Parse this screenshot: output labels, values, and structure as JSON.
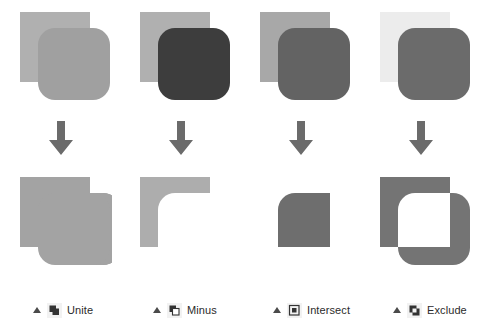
{
  "page": {
    "background": "#ffffff"
  },
  "colors": {
    "light_gray": "#aaaaaa",
    "mid_gray": "#999999",
    "pale_gray": "#b3b3b3",
    "very_light_gray": "#eeeeee",
    "dark_gray": "#6e6e6e",
    "darkest_gray": "#3d3d3d",
    "arrow": "#6b6b6b",
    "caption_text": "#2b2b2b",
    "caption_marker": "#4a4a4a",
    "icon_dark": "#333333",
    "icon_frame": "#f2f2f2",
    "result_unite": "#a3a3a3",
    "result_minus": "#adadad",
    "result_intersect": "#6e6e6e",
    "result_exclude": "#747474"
  },
  "panels": [
    {
      "id": "unite",
      "label": "Unite",
      "icon_name": "unite-icon",
      "marker": "triangle-up",
      "source": {
        "square_color": "#b0b0b0",
        "rounded_color": "#a0a0a0",
        "square_label": "back-square",
        "rounded_label": "front-rounded-square"
      },
      "arrow": {
        "name": "down-arrow-icon",
        "color": "#6b6b6b"
      },
      "result": {
        "name": "unite-result-shape",
        "fill": "#a3a3a3",
        "description": "union of square and rounded square"
      }
    },
    {
      "id": "minus",
      "label": "Minus",
      "icon_name": "minus-front-icon",
      "marker": "triangle-up",
      "source": {
        "square_color": "#b0b0b0",
        "rounded_color": "#3d3d3d",
        "square_label": "back-square",
        "rounded_label": "front-rounded-square"
      },
      "arrow": {
        "name": "down-arrow-icon",
        "color": "#6b6b6b"
      },
      "result": {
        "name": "minus-result-shape",
        "fill": "#adadad",
        "description": "square with rounded square subtracted, L shape"
      }
    },
    {
      "id": "intersect",
      "label": "Intersect",
      "icon_name": "intersect-icon",
      "marker": "triangle-up",
      "source": {
        "square_color": "#a8a8a8",
        "rounded_color": "#636363",
        "square_label": "back-square",
        "rounded_label": "front-rounded-square"
      },
      "arrow": {
        "name": "down-arrow-icon",
        "color": "#6b6b6b"
      },
      "result": {
        "name": "intersect-result-shape",
        "fill": "#6e6e6e",
        "description": "overlap region with one rounded corner"
      }
    },
    {
      "id": "exclude",
      "label": "Exclude",
      "icon_name": "exclude-icon",
      "marker": "triangle-up",
      "source": {
        "square_color": "#ececec",
        "rounded_color": "#6b6b6b",
        "square_label": "back-square",
        "rounded_label": "front-rounded-square"
      },
      "arrow": {
        "name": "down-arrow-icon",
        "color": "#6b6b6b"
      },
      "result": {
        "name": "exclude-result-shape",
        "fill": "#747474",
        "description": "union minus overlap, hollow center"
      }
    }
  ]
}
